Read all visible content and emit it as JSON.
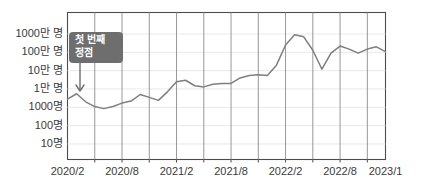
{
  "chart_data": {
    "type": "line",
    "title": "",
    "subtitle": "",
    "xlabel": "",
    "ylabel": "",
    "yscale": "log",
    "ylim": [
      10,
      10000000
    ],
    "grid": "vertical-major-horizontal-minor",
    "legend": "none",
    "y_tick_labels": [
      "1000만 명",
      "100만 명",
      "10만 명",
      "1만 명",
      "1000명",
      "100명",
      "10명"
    ],
    "y_tick_values": [
      10000000,
      1000000,
      100000,
      10000,
      1000,
      100,
      10
    ],
    "x_tick_labels": [
      "2020/2",
      "2020/8",
      "2021/2",
      "2021/8",
      "2022/2",
      "2022/8",
      "2023/1"
    ],
    "x_tick_values": [
      "2020-02",
      "2020-08",
      "2021-02",
      "2021-08",
      "2022-02",
      "2022-08",
      "2023-01"
    ],
    "series": [
      {
        "name": "사용자 수",
        "color": "#7f7f7f",
        "x": [
          "2020-02",
          "2020-03",
          "2020-04",
          "2020-05",
          "2020-06",
          "2020-07",
          "2020-08",
          "2020-09",
          "2020-10",
          "2020-11",
          "2020-12",
          "2021-01",
          "2021-02",
          "2021-03",
          "2021-04",
          "2021-05",
          "2021-06",
          "2021-07",
          "2021-08",
          "2021-09",
          "2021-10",
          "2021-11",
          "2021-12",
          "2022-01",
          "2022-02",
          "2022-03",
          "2022-04",
          "2022-05",
          "2022-06",
          "2022-07",
          "2022-08",
          "2022-09",
          "2022-10",
          "2022-11",
          "2022-12",
          "2023-01"
        ],
        "values": [
          2800,
          5500,
          2000,
          1100,
          850,
          1100,
          1700,
          2200,
          5000,
          3500,
          2400,
          7000,
          25000,
          30000,
          15000,
          13000,
          18000,
          20000,
          20000,
          40000,
          55000,
          60000,
          55000,
          200000,
          2500000,
          9000000,
          7000000,
          1300000,
          120000,
          900000,
          2200000,
          1500000,
          900000,
          1500000,
          2000000,
          1100000
        ]
      }
    ],
    "annotations": [
      {
        "label_line1": "첫 번째",
        "label_line2": "정점",
        "target_x": "2020-03",
        "target_y": 5500,
        "arrow": "down",
        "box_color": "#6e6e6e",
        "text_color": "#ffffff"
      }
    ]
  },
  "colors": {
    "line": "#7f7f7f",
    "plot_border": "#4d4d4d",
    "vertical_grid": "#8c8c8c",
    "horizontal_grid": "#e6e6e6",
    "background": "#ffffff",
    "tick_label": "#3a3a3a",
    "annotation_box": "#6e6e6e",
    "annotation_text": "#ffffff"
  }
}
